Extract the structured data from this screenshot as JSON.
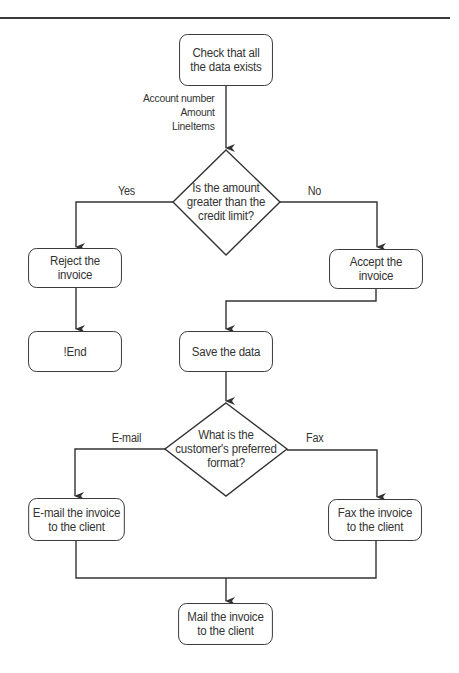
{
  "diagram": {
    "type": "flowchart",
    "colors": {
      "stroke": "#333333",
      "text": "#333333",
      "background": "#ffffff"
    },
    "nodes": {
      "check_data": {
        "shape": "rounded-rect",
        "label": "Check that all\nthe data exists"
      },
      "credit_decision": {
        "shape": "diamond",
        "label": "Is the amount\ngreater than the\ncredit limit?"
      },
      "reject": {
        "shape": "rounded-rect",
        "label": "Reject the\ninvoice"
      },
      "accept": {
        "shape": "rounded-rect",
        "label": "Accept the\ninvoice"
      },
      "end": {
        "shape": "rounded-rect",
        "label": "!End"
      },
      "save": {
        "shape": "rounded-rect",
        "label": "Save the data"
      },
      "format_decision": {
        "shape": "diamond",
        "label": "What is the\ncustomer's preferred\nformat?"
      },
      "email": {
        "shape": "rounded-rect",
        "label": "E-mail the invoice\nto the client"
      },
      "fax": {
        "shape": "rounded-rect",
        "label": "Fax the invoice\nto the client"
      },
      "mail": {
        "shape": "rounded-rect",
        "label": "Mail the invoice\nto the client"
      }
    },
    "data_items": [
      "Account number",
      "Amount",
      "LineItems"
    ],
    "edges": [
      {
        "from": "check_data",
        "to": "credit_decision",
        "label": ""
      },
      {
        "from": "credit_decision",
        "to": "reject",
        "label": "Yes"
      },
      {
        "from": "credit_decision",
        "to": "accept",
        "label": "No"
      },
      {
        "from": "reject",
        "to": "end",
        "label": ""
      },
      {
        "from": "accept",
        "to": "save",
        "label": ""
      },
      {
        "from": "save",
        "to": "format_decision",
        "label": ""
      },
      {
        "from": "format_decision",
        "to": "email",
        "label": "E-mail"
      },
      {
        "from": "format_decision",
        "to": "fax",
        "label": "Fax"
      },
      {
        "from": "email",
        "to": "mail",
        "label": ""
      },
      {
        "from": "fax",
        "to": "mail",
        "label": ""
      }
    ],
    "edge_labels": {
      "yes": "Yes",
      "no": "No",
      "email": "E-mail",
      "fax": "Fax"
    }
  }
}
